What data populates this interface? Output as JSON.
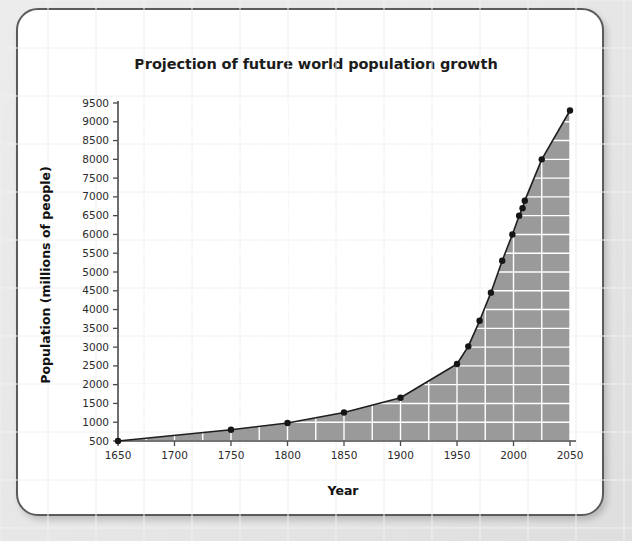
{
  "card": {
    "background_color": "#ffffff",
    "border_color": "#5b5b5b"
  },
  "chart_data": {
    "type": "area",
    "title": "Projection of future world population growth",
    "xlabel": "Year",
    "ylabel": "Population (millions of people)",
    "xlim": [
      1650,
      2050
    ],
    "ylim": [
      500,
      9500
    ],
    "grid": true,
    "legend": "none",
    "series_color": "#9a9a9a",
    "line_color": "#1e1e1e",
    "x_ticks": [
      1650,
      1700,
      1750,
      1800,
      1850,
      1900,
      1950,
      2000,
      2050
    ],
    "y_ticks": [
      500,
      1000,
      1500,
      2000,
      2500,
      3000,
      3500,
      4000,
      4500,
      5000,
      5500,
      6000,
      6500,
      7000,
      7500,
      8000,
      8500,
      9000,
      9500
    ],
    "x": [
      1650,
      1750,
      1800,
      1850,
      1900,
      1950,
      1960,
      1970,
      1980,
      1990,
      1999,
      2005,
      2008,
      2010,
      2025,
      2050
    ],
    "values": [
      500,
      800,
      980,
      1260,
      1650,
      2550,
      3020,
      3700,
      4450,
      5300,
      6000,
      6500,
      6700,
      6900,
      8000,
      9300
    ],
    "points": [
      {
        "year": 1650,
        "population": 500
      },
      {
        "year": 1750,
        "population": 800
      },
      {
        "year": 1800,
        "population": 980
      },
      {
        "year": 1850,
        "population": 1260
      },
      {
        "year": 1900,
        "population": 1650
      },
      {
        "year": 1950,
        "population": 2550
      },
      {
        "year": 1960,
        "population": 3020
      },
      {
        "year": 1970,
        "population": 3700
      },
      {
        "year": 1980,
        "population": 4450
      },
      {
        "year": 1990,
        "population": 5300
      },
      {
        "year": 1999,
        "population": 6000
      },
      {
        "year": 2005,
        "population": 6500
      },
      {
        "year": 2008,
        "population": 6700
      },
      {
        "year": 2010,
        "population": 6900
      },
      {
        "year": 2025,
        "population": 8000
      },
      {
        "year": 2050,
        "population": 9300
      }
    ]
  }
}
